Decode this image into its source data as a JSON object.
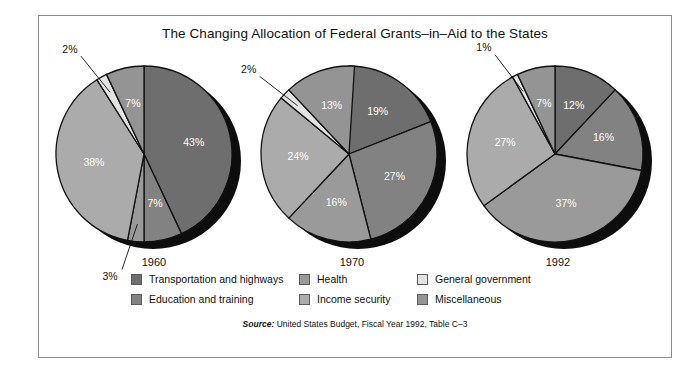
{
  "title": "The Changing Allocation of Federal Grants–in–Aid to the States",
  "source": {
    "prefix": "Source:",
    "text": " United States Budget, Fiscal Year 1992, Table C–3"
  },
  "legend": {
    "items": [
      {
        "label": "Transportation and highways",
        "color": "#6e6e6e",
        "name": "transportation-and-highways"
      },
      {
        "label": "Health",
        "color": "#9a9a9a",
        "name": "health"
      },
      {
        "label": "General government",
        "color": "#e3e3e3",
        "name": "general-government"
      },
      {
        "label": "Education and training",
        "color": "#828282",
        "name": "education-and-training"
      },
      {
        "label": "Income security",
        "color": "#ababab",
        "name": "income-security"
      },
      {
        "label": "Miscellaneous",
        "color": "#949494",
        "name": "miscellaneous"
      }
    ]
  },
  "chart_data": {
    "type": "pie",
    "title": "The Changing Allocation of Federal Grants–in–Aid to the States",
    "categories": [
      "Transportation and highways",
      "Education and training",
      "Health",
      "Income security",
      "General government",
      "Miscellaneous"
    ],
    "colors": [
      "#6e6e6e",
      "#828282",
      "#9a9a9a",
      "#ababab",
      "#e3e3e3",
      "#949494"
    ],
    "legend_position": "bottom",
    "units": "percent",
    "charts": [
      {
        "year": "1960",
        "values": [
          43,
          7,
          3,
          38,
          2,
          7
        ],
        "labels": [
          "43%",
          "7%",
          "3%",
          "38%",
          "2%",
          "7%"
        ],
        "callout": [
          false,
          false,
          true,
          false,
          true,
          false
        ]
      },
      {
        "year": "1970",
        "values": [
          19,
          27,
          16,
          24,
          2,
          13
        ],
        "labels": [
          "19%",
          "27%",
          "16%",
          "24%",
          "2%",
          "13%"
        ],
        "callout": [
          false,
          false,
          false,
          false,
          true,
          false
        ]
      },
      {
        "year": "1992",
        "values": [
          12,
          16,
          37,
          27,
          1,
          7
        ],
        "labels": [
          "12%",
          "16%",
          "37%",
          "27%",
          "1%",
          "7%"
        ],
        "callout": [
          false,
          false,
          false,
          false,
          true,
          false
        ]
      }
    ]
  }
}
